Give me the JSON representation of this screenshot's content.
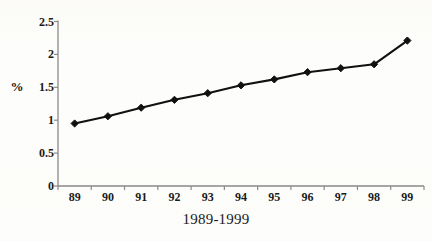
{
  "chart_data": {
    "type": "line",
    "title": "",
    "xlabel": "1989-1999",
    "ylabel": "%",
    "categories": [
      "89",
      "90",
      "91",
      "92",
      "93",
      "94",
      "95",
      "96",
      "97",
      "98",
      "99"
    ],
    "values": [
      0.95,
      1.06,
      1.19,
      1.31,
      1.41,
      1.53,
      1.62,
      1.73,
      1.79,
      1.85,
      2.21
    ],
    "series": [
      {
        "name": "",
        "values": [
          0.95,
          1.06,
          1.19,
          1.31,
          1.41,
          1.53,
          1.62,
          1.73,
          1.79,
          1.85,
          2.21
        ]
      }
    ],
    "ylim": [
      0,
      2.5
    ],
    "y_ticks": [
      "0",
      "0.5",
      "1",
      "1.5",
      "2",
      "2.5"
    ],
    "y_tick_values": [
      0,
      0.5,
      1,
      1.5,
      2,
      2.5
    ],
    "grid": false,
    "legend": false,
    "legend_position": "none",
    "marker": "diamond",
    "line_color": "#111111",
    "marker_color": "#111111",
    "axis_color": "#8a8a8a",
    "background": "#fdfdfb"
  }
}
